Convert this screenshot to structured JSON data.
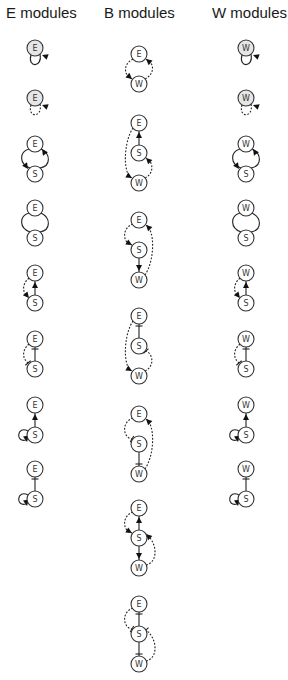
{
  "headers": {
    "e": "E modules",
    "b": "B modules",
    "w": "W modules"
  },
  "columns": {
    "e": {
      "x": 35,
      "modules": [
        {
          "nodes": [
            {
              "id": "E",
              "y": 48,
              "filled": true
            }
          ],
          "edges": [
            {
              "type": "self",
              "node": "E",
              "style": "solid",
              "end": "arrow",
              "side": "below"
            }
          ]
        },
        {
          "nodes": [
            {
              "id": "E",
              "y": 98,
              "filled": true
            }
          ],
          "edges": [
            {
              "type": "self",
              "node": "E",
              "style": "dashed",
              "end": "arrow",
              "side": "below"
            }
          ]
        },
        {
          "nodes": [
            {
              "id": "E",
              "y": 144
            },
            {
              "id": "S",
              "y": 174
            }
          ],
          "edges": [
            {
              "type": "loop2",
              "style": "solid",
              "end": "arrow-both"
            }
          ]
        },
        {
          "nodes": [
            {
              "id": "E",
              "y": 208
            },
            {
              "id": "S",
              "y": 238
            }
          ],
          "edges": [
            {
              "type": "loop2",
              "style": "solid",
              "end": "none"
            }
          ]
        },
        {
          "nodes": [
            {
              "id": "E",
              "y": 273
            },
            {
              "id": "S",
              "y": 303
            }
          ],
          "edges": [
            {
              "type": "link",
              "style": "solid",
              "end": "arrow"
            },
            {
              "type": "side",
              "style": "dashed",
              "end": "arrow"
            }
          ]
        },
        {
          "nodes": [
            {
              "id": "E",
              "y": 339
            },
            {
              "id": "S",
              "y": 369
            }
          ],
          "edges": [
            {
              "type": "link",
              "style": "solid",
              "end": "bar"
            },
            {
              "type": "side",
              "style": "dashed",
              "end": "bar"
            }
          ]
        },
        {
          "nodes": [
            {
              "id": "E",
              "y": 405
            },
            {
              "id": "S",
              "y": 435
            }
          ],
          "edges": [
            {
              "type": "link",
              "style": "solid",
              "end": "arrow"
            },
            {
              "type": "selfS",
              "style": "solid",
              "end": "arrow"
            }
          ]
        },
        {
          "nodes": [
            {
              "id": "E",
              "y": 469
            },
            {
              "id": "S",
              "y": 499
            }
          ],
          "edges": [
            {
              "type": "link",
              "style": "solid",
              "end": "bar"
            },
            {
              "type": "selfS",
              "style": "solid",
              "end": "arrow"
            }
          ]
        }
      ]
    },
    "b": {
      "x": 139,
      "modules": [
        {
          "nodes": [
            {
              "id": "E",
              "y": 54
            },
            {
              "id": "W",
              "y": 84
            }
          ],
          "edges": [
            {
              "type": "bloop",
              "style": "dashed"
            }
          ]
        },
        {
          "nodes": [
            {
              "id": "E",
              "y": 123
            },
            {
              "id": "S",
              "y": 153
            },
            {
              "id": "W",
              "y": 183
            }
          ],
          "edges": [
            {
              "type": "chain",
              "variant": 1
            }
          ]
        },
        {
          "nodes": [
            {
              "id": "E",
              "y": 220
            },
            {
              "id": "S",
              "y": 250
            },
            {
              "id": "W",
              "y": 280
            }
          ],
          "edges": [
            {
              "type": "chain",
              "variant": 2
            }
          ]
        },
        {
          "nodes": [
            {
              "id": "E",
              "y": 316
            },
            {
              "id": "S",
              "y": 346
            },
            {
              "id": "W",
              "y": 376
            }
          ],
          "edges": [
            {
              "type": "chain",
              "variant": 3
            }
          ]
        },
        {
          "nodes": [
            {
              "id": "E",
              "y": 414
            },
            {
              "id": "S",
              "y": 444
            },
            {
              "id": "W",
              "y": 474
            }
          ],
          "edges": [
            {
              "type": "chain",
              "variant": 4
            }
          ]
        },
        {
          "nodes": [
            {
              "id": "E",
              "y": 508
            },
            {
              "id": "S",
              "y": 538
            },
            {
              "id": "W",
              "y": 568
            }
          ],
          "edges": [
            {
              "type": "chain",
              "variant": 5
            }
          ]
        },
        {
          "nodes": [
            {
              "id": "E",
              "y": 604
            },
            {
              "id": "S",
              "y": 634
            },
            {
              "id": "W",
              "y": 664
            }
          ],
          "edges": [
            {
              "type": "chain",
              "variant": 6
            }
          ]
        }
      ]
    },
    "w": {
      "x": 246,
      "modules": [
        {
          "nodes": [
            {
              "id": "W",
              "y": 48,
              "filled": true
            }
          ],
          "edges": [
            {
              "type": "self",
              "node": "W",
              "style": "solid",
              "end": "arrow",
              "side": "below"
            }
          ]
        },
        {
          "nodes": [
            {
              "id": "W",
              "y": 98,
              "filled": true
            }
          ],
          "edges": [
            {
              "type": "self",
              "node": "W",
              "style": "dashed",
              "end": "arrow",
              "side": "below"
            }
          ]
        },
        {
          "nodes": [
            {
              "id": "W",
              "y": 144
            },
            {
              "id": "S",
              "y": 174
            }
          ],
          "edges": [
            {
              "type": "loop2",
              "style": "solid",
              "end": "arrow-both"
            }
          ]
        },
        {
          "nodes": [
            {
              "id": "W",
              "y": 208
            },
            {
              "id": "S",
              "y": 238
            }
          ],
          "edges": [
            {
              "type": "loop2",
              "style": "solid",
              "end": "none"
            }
          ]
        },
        {
          "nodes": [
            {
              "id": "W",
              "y": 273
            },
            {
              "id": "S",
              "y": 303
            }
          ],
          "edges": [
            {
              "type": "link",
              "style": "solid",
              "end": "arrow"
            },
            {
              "type": "side",
              "style": "dashed",
              "end": "arrow"
            }
          ]
        },
        {
          "nodes": [
            {
              "id": "W",
              "y": 339
            },
            {
              "id": "S",
              "y": 369
            }
          ],
          "edges": [
            {
              "type": "link",
              "style": "solid",
              "end": "bar"
            },
            {
              "type": "side",
              "style": "dashed",
              "end": "bar"
            }
          ]
        },
        {
          "nodes": [
            {
              "id": "W",
              "y": 405
            },
            {
              "id": "S",
              "y": 435
            }
          ],
          "edges": [
            {
              "type": "link",
              "style": "solid",
              "end": "arrow"
            },
            {
              "type": "selfS",
              "style": "solid",
              "end": "arrow"
            }
          ]
        },
        {
          "nodes": [
            {
              "id": "W",
              "y": 469
            },
            {
              "id": "S",
              "y": 499
            }
          ],
          "edges": [
            {
              "type": "link",
              "style": "solid",
              "end": "bar"
            },
            {
              "type": "selfS",
              "style": "solid",
              "end": "arrow"
            }
          ]
        }
      ]
    }
  },
  "node_radius": 8
}
